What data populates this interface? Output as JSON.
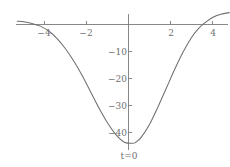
{
  "chart_data": {
    "type": "line",
    "title": "",
    "subtitle": "",
    "xlabel": "",
    "ylabel": "",
    "xlim": [
      -5.3,
      4.8
    ],
    "ylim": [
      -47,
      9
    ],
    "grid": false,
    "legend_position": "none",
    "annotations": [
      {
        "text": "t=0",
        "x": 0,
        "y": -47,
        "placement": "below-axis-origin"
      }
    ],
    "x_ticks": [
      -4,
      -2,
      2,
      4
    ],
    "x_tick_labels": [
      "−4",
      "−2",
      "2",
      "4"
    ],
    "y_ticks": [
      -10,
      -20,
      -30,
      -40
    ],
    "y_tick_labels": [
      "−10",
      "−20",
      "−30",
      "−40"
    ],
    "axes": {
      "x_axis_at_y": 0,
      "y_axis_at_x": 0,
      "x_axis_visible": true,
      "y_axis_visible": true
    },
    "series": [
      {
        "name": "curve",
        "color": "#6f6f6f",
        "x": [
          -5.3,
          -5.0,
          -4.6,
          -4.2,
          -3.8,
          -3.4,
          -3.0,
          -2.6,
          -2.2,
          -1.8,
          -1.4,
          -1.0,
          -0.6,
          -0.2,
          0.2,
          0.35,
          0.6,
          1.0,
          1.4,
          1.8,
          2.2,
          2.6,
          3.0,
          3.3,
          3.6,
          4.0,
          4.4,
          4.8
        ],
        "y": [
          1.2,
          1.0,
          0.4,
          -0.6,
          -2.4,
          -5.2,
          -9.0,
          -13.6,
          -19.0,
          -25.0,
          -31.0,
          -36.4,
          -40.8,
          -43.6,
          -44.0,
          -43.6,
          -41.8,
          -37.0,
          -30.6,
          -23.6,
          -16.6,
          -10.2,
          -4.8,
          -1.8,
          0.4,
          2.6,
          3.8,
          4.4
        ]
      }
    ],
    "minimum": {
      "x": 0.3,
      "y": -44
    },
    "colors": {
      "axis": "#7a7a7a",
      "curve": "#6f6f6f",
      "tick_label": "#6f6f6f",
      "background": "#ffffff"
    }
  }
}
